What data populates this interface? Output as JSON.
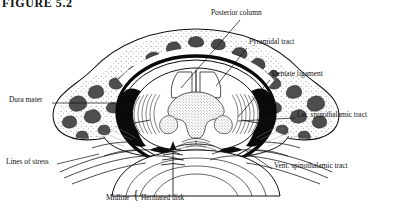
{
  "figure": {
    "title": "FIGURE 5.2",
    "background_color": "#ffffff",
    "ink_color": "#101010"
  },
  "labels": [
    {
      "id": "posterior-column",
      "text": "Posterior column",
      "x": 211,
      "y": 13,
      "anchor": "start"
    },
    {
      "id": "pyramidal-tract",
      "text": "Pyramidal tract",
      "x": 249,
      "y": 42,
      "anchor": "start"
    },
    {
      "id": "dentate-ligament",
      "text": "Dentate ligament",
      "x": 272,
      "y": 74,
      "anchor": "start"
    },
    {
      "id": "lat-spinothalamic",
      "text": "Lat. spinothalamic tract",
      "x": 297,
      "y": 115,
      "anchor": "start"
    },
    {
      "id": "vent-spinothalamic",
      "text": "Vent. spinothalamic tract",
      "x": 274,
      "y": 166,
      "anchor": "start"
    },
    {
      "id": "dura-mater",
      "text": "Dura mater",
      "x": 9,
      "y": 100,
      "anchor": "start"
    },
    {
      "id": "lines-of-stress",
      "text": "Lines of stress",
      "x": 6,
      "y": 162,
      "anchor": "start"
    },
    {
      "id": "midline",
      "text": "Midline",
      "x": 106,
      "y": 198,
      "anchor": "start"
    },
    {
      "id": "herniated-disk",
      "text": "Herniated disk",
      "x": 141,
      "y": 198,
      "anchor": "start"
    }
  ],
  "brace": {
    "glyph": "{",
    "x": 133,
    "y": 193
  },
  "leaders": [
    {
      "id": "leader-posterior-column",
      "from": [
        240,
        20
      ],
      "to": [
        181,
        88
      ]
    },
    {
      "id": "leader-pyramidal-tract",
      "from": [
        247,
        48
      ],
      "to": [
        216,
        86
      ]
    },
    {
      "id": "leader-dentate-ligament",
      "from": [
        270,
        80
      ],
      "to": [
        238,
        117
      ]
    },
    {
      "id": "leader-lat-spinothalamic",
      "from": [
        295,
        118
      ],
      "to": [
        238,
        121
      ]
    },
    {
      "id": "leader-vent-spinothalamic",
      "from": [
        272,
        169
      ],
      "to": [
        245,
        150
      ]
    },
    {
      "id": "leader-dura-mater",
      "from": [
        52,
        103
      ],
      "to": [
        116,
        103
      ]
    },
    {
      "id": "leader-lines-of-stress",
      "from": [
        57,
        164
      ],
      "to": [
        99,
        154
      ]
    }
  ],
  "arrow": {
    "id": "disk-pressure-arrow",
    "x": 173,
    "y_tail": 196,
    "y_head": 142,
    "ticks": [
      150,
      155,
      160,
      165
    ]
  },
  "anatomy": {
    "structures": [
      "vertebral body",
      "spinal canal",
      "dura mater",
      "spinal cord",
      "gray matter (butterfly)",
      "posterior columns",
      "cancellous bone",
      "herniated intervertebral disk",
      "dentate ligament"
    ]
  }
}
